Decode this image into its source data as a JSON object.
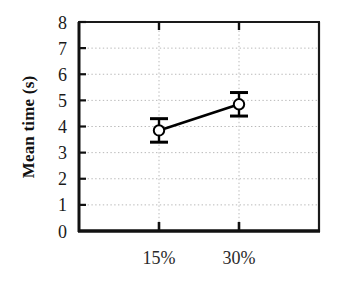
{
  "chart_data": {
    "type": "line",
    "title": "",
    "xlabel": "",
    "ylabel": "Mean time (s)",
    "categories": [
      "15%",
      "30%"
    ],
    "values": [
      3.85,
      4.85
    ],
    "errors": [
      0.45,
      0.45
    ],
    "series": [
      {
        "name": "Mean time",
        "values": [
          3.85,
          4.85
        ],
        "errors": [
          0.45,
          0.45
        ],
        "marker": "open-circle",
        "line_color": "#000000",
        "marker_fill": "#ffffff",
        "marker_edge": "#000000"
      }
    ],
    "ylim": [
      0,
      8
    ],
    "yticks": [
      0,
      1,
      2,
      3,
      4,
      5,
      6,
      7,
      8
    ],
    "ytick_labels": [
      "0",
      "1",
      "2",
      "3",
      "4",
      "5",
      "6",
      "7",
      "8"
    ],
    "xtick_labels": [
      "15%",
      "30%"
    ],
    "grid": true,
    "grid_style": "dotted",
    "grid_color": "#b9b9b9",
    "legend": false,
    "legend_position": "none",
    "frame_color": "#1a1a1a",
    "background": "#ffffff"
  },
  "axis": {
    "y_label": "Mean time (s)",
    "y_ticks": [
      "8",
      "7",
      "6",
      "5",
      "4",
      "3",
      "2",
      "1",
      "0"
    ],
    "x_ticks": [
      "15%",
      "30%"
    ]
  },
  "points": [
    {
      "category": "15%",
      "value": "3.85",
      "error": "0.45"
    },
    {
      "category": "30%",
      "value": "4.85",
      "error": "0.45"
    }
  ]
}
